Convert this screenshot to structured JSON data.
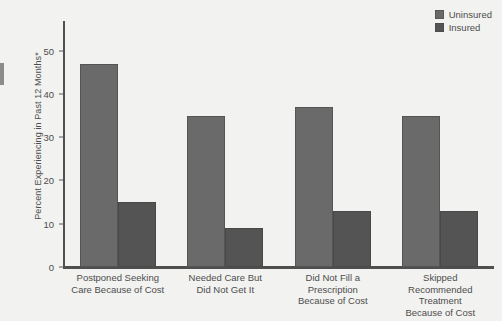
{
  "chart_data": {
    "type": "bar",
    "title": "",
    "xlabel": "",
    "ylabel": "Percent Experiencing in Past 12 Months*",
    "ylim": [
      0,
      55
    ],
    "yticks": [
      0,
      10,
      20,
      30,
      40,
      50
    ],
    "grid": false,
    "legend_position": "top-right",
    "categories": [
      "Postponed Seeking Care Because of Cost",
      "Needed Care But Did Not Get It",
      "Did Not Fill a Prescription Because of Cost",
      "Skipped Recommended Treatment Because of Cost"
    ],
    "category_lines": [
      [
        "Postponed Seeking",
        "Care Because of Cost"
      ],
      [
        "Needed Care But",
        "Did Not Get It"
      ],
      [
        "Did Not Fill a",
        "Prescription",
        "Because of Cost"
      ],
      [
        "Skipped",
        "Recommended",
        "Treatment",
        "Because of Cost"
      ]
    ],
    "series": [
      {
        "name": "Uninsured",
        "color": "#6a6a6a",
        "values": [
          47,
          35,
          37,
          35
        ]
      },
      {
        "name": "Insured",
        "color": "#545454",
        "values": [
          15,
          9,
          13,
          13
        ]
      }
    ]
  },
  "legend": {
    "items": [
      {
        "label": "Uninsured"
      },
      {
        "label": "Insured"
      }
    ]
  },
  "axis": {
    "y_title": "Percent Experiencing in Past 12 Months*",
    "y_tick_labels": [
      "0",
      "10",
      "20",
      "30",
      "40",
      "50"
    ]
  }
}
